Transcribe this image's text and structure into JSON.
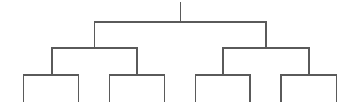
{
  "diagram": {
    "type": "binary-tree-dendrogram",
    "width": 356,
    "height": 110,
    "line_color": "#5a5a5a",
    "line_width": 1.2,
    "levels": 3,
    "leaf_count": 8,
    "root": {
      "x": 180.5,
      "stem_top": 3,
      "bar_y": 22
    },
    "nodes": [
      {
        "id": "root",
        "x": 180.5,
        "top": 3,
        "bar_y": 22,
        "children": [
          "L",
          "R"
        ]
      },
      {
        "id": "L",
        "x": 94.5,
        "top": 22,
        "bar_y": 48,
        "children": [
          "LL",
          "LR"
        ]
      },
      {
        "id": "R",
        "x": 266,
        "top": 22,
        "bar_y": 48,
        "children": [
          "RL",
          "RR"
        ]
      },
      {
        "id": "LL",
        "x": 52,
        "top": 48,
        "bar_y": 75,
        "children": [
          "LLL",
          "LLR"
        ]
      },
      {
        "id": "LR",
        "x": 137,
        "top": 48,
        "bar_y": 75,
        "children": [
          "LRL",
          "LRR"
        ]
      },
      {
        "id": "RL",
        "x": 223,
        "top": 48,
        "bar_y": 75,
        "children": [
          "RLL",
          "RLR"
        ]
      },
      {
        "id": "RR",
        "x": 309,
        "top": 48,
        "bar_y": 75,
        "children": [
          "RRL",
          "RRR"
        ]
      },
      {
        "id": "LLL",
        "x": 23.5,
        "top": 75,
        "bottom": 101
      },
      {
        "id": "LLR",
        "x": 78.5,
        "top": 75,
        "bottom": 101
      },
      {
        "id": "LRL",
        "x": 109.5,
        "top": 75,
        "bottom": 101
      },
      {
        "id": "LRR",
        "x": 164.5,
        "top": 75,
        "bottom": 101
      },
      {
        "id": "RLL",
        "x": 195.5,
        "top": 75,
        "bottom": 101
      },
      {
        "id": "RLR",
        "x": 250,
        "top": 75,
        "bottom": 101
      },
      {
        "id": "RRL",
        "x": 281,
        "top": 75,
        "bottom": 101
      },
      {
        "id": "RRR",
        "x": 336.5,
        "top": 75,
        "bottom": 101
      }
    ]
  }
}
